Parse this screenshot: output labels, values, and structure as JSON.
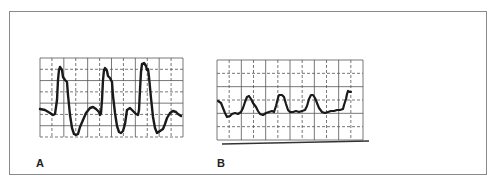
{
  "figure": {
    "panels": [
      {
        "label": "A",
        "description": "High-amplitude pulsatile waveform with three sharp peaks",
        "grid": {
          "x": 40,
          "y": 58,
          "width": 143,
          "height": 79,
          "cols": 12,
          "rows": 7
        },
        "trace": "40,109 45,110 50,113 53,115 55,114 57,100 58,80 59,70 60,67 62,70 63,77 65,80 67,82 68,95 70,115 72,128 74,134 76,135 78,134 80,127 83,120 86,113 90,108 93,107 96,109 99,112 100,115 101,113 102,100 103,80 104,70 105,68 107,71 108,76 110,78 112,82 113,96 115,113 117,126 119,132 121,133 123,131 125,124 126,117 127,110 130,108 133,111 136,114 138,115 139,110 140,90 141,72 142,64 144,63 146,66 147,70 148,69 149,77 151,98 153,117 155,128 157,133 160,131 163,129 165,124 167,118 170,113 173,111 176,112 178,114 181,116"
      },
      {
        "label": "B",
        "description": "Low-amplitude dampened waveform with rounded peaks",
        "grid": {
          "x": 217,
          "y": 60,
          "width": 146,
          "height": 80,
          "cols": 12,
          "rows": 6
        },
        "baseline": {
          "x1": 222,
          "y1": 144,
          "x2": 369,
          "y2": 141
        },
        "trace": "218,101 221,103 223,108 225,113 227,117 230,116 232,114 235,113 238,114 241,112 243,108 245,102 247,97 249,96 251,99 253,103 256,107 258,111 260,114 263,115 266,113 269,112 272,111 274,112 276,106 278,98 279,95 282,95 284,97 286,104 288,110 290,112 293,112 296,111 299,112 302,111 305,110 307,106 309,99 311,95 313,95 315,98 317,103 319,108 322,112 325,113 328,112 331,111 334,111 337,110 340,110 343,109 344,105 346,99 347,94 348,91 350,92 351,92"
      }
    ],
    "colors": {
      "trace": "#1a1a1a",
      "grid": "#555555",
      "border": "#8a8a8a",
      "background": "#ffffff"
    }
  }
}
